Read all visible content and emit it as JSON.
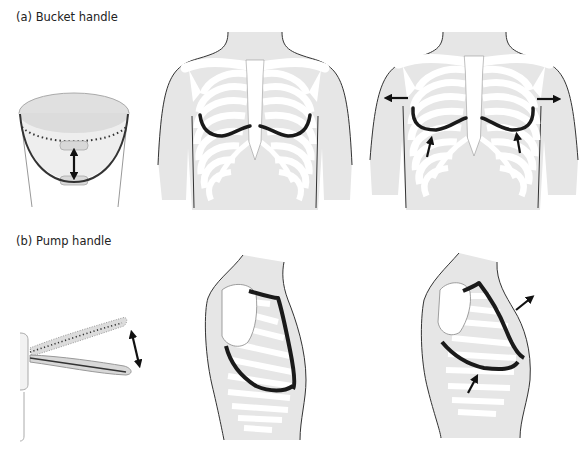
{
  "panels": [
    {
      "id": "a",
      "label": "(a) Bucket handle",
      "figures": [
        {
          "name": "bucket-model",
          "description": "Bucket with handle raising vertically; double-headed arrow"
        },
        {
          "name": "anterior-chest-rest",
          "description": "Front view of thorax with lower ribs highlighted (rest)"
        },
        {
          "name": "anterior-chest-inspiration",
          "description": "Front view of thorax with lower ribs elevated; lateral outward arrows and upward arrows"
        }
      ]
    },
    {
      "id": "b",
      "label": "(b) Pump handle",
      "figures": [
        {
          "name": "pump-handle-model",
          "description": "Pump handle pivoting on wall mount; double-headed arrow"
        },
        {
          "name": "lateral-chest-rest",
          "description": "Side view of thorax with rib and sternum highlighted (rest)"
        },
        {
          "name": "lateral-chest-inspiration",
          "description": "Side view of thorax with sternum moved anteriorly/upward; arrows"
        }
      ]
    }
  ],
  "colors": {
    "body_fill": "#e6e6e6",
    "bone_fill": "#ffffff",
    "outline": "#333333",
    "highlight": "#1a1a1a",
    "arrow": "#111111"
  }
}
